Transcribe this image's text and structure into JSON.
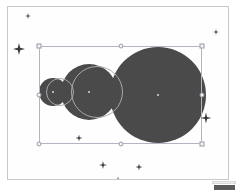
{
  "app": {
    "name": "vector-graphics-editor-canvas",
    "canvas_background": "#ffffff",
    "frame_border_color": "#c9c9c9"
  },
  "canvas": {
    "width": 237,
    "height": 191,
    "frame": {
      "x": 7,
      "y": 6,
      "width": 222,
      "height": 174
    }
  },
  "selection": {
    "label": "",
    "box": {
      "x": 38,
      "y": 45,
      "width": 163,
      "height": 98
    },
    "border_color": "#b4b4c4",
    "handle_fill": "#f4f4f6",
    "handle_border": "#9a9aa8",
    "handles": [
      {
        "name": "handle-top-left",
        "x": 38,
        "y": 45,
        "shape": "square"
      },
      {
        "name": "handle-top-center",
        "x": 119.5,
        "y": 45,
        "shape": "round"
      },
      {
        "name": "handle-top-right",
        "x": 201,
        "y": 45,
        "shape": "square"
      },
      {
        "name": "handle-middle-left",
        "x": 38,
        "y": 94,
        "shape": "round"
      },
      {
        "name": "handle-middle-right",
        "x": 201,
        "y": 94,
        "shape": "round"
      },
      {
        "name": "handle-bottom-left",
        "x": 38,
        "y": 143,
        "shape": "round"
      },
      {
        "name": "handle-bottom-center",
        "x": 119.5,
        "y": 143,
        "shape": "round"
      },
      {
        "name": "handle-bottom-right",
        "x": 201,
        "y": 143,
        "shape": "square"
      }
    ]
  },
  "shapes": [
    {
      "name": "circle-small",
      "type": "circle",
      "cx": 52,
      "cy": 91,
      "r": 14,
      "fill": "#4a4a4a",
      "style": "filled",
      "center_dot": true
    },
    {
      "name": "circle-medium",
      "type": "circle",
      "cx": 88,
      "cy": 91,
      "r": 28,
      "fill": "#4a4a4a",
      "style": "filled",
      "center_dot": true
    },
    {
      "name": "circle-large",
      "type": "circle",
      "cx": 157,
      "cy": 94,
      "r": 48,
      "fill": "#4a4a4a",
      "style": "filled",
      "center_dot": true
    },
    {
      "name": "circle-outline-overlay-small",
      "type": "circle",
      "cx": 59,
      "cy": 91,
      "r": 14,
      "fill": "none",
      "stroke": "#a9a9a9",
      "style": "outlined",
      "center_dot": false
    },
    {
      "name": "circle-outline-overlay-medium",
      "type": "circle",
      "cx": 96,
      "cy": 91,
      "r": 26,
      "fill": "none",
      "stroke": "#a9a9a9",
      "style": "outlined",
      "center_dot": false
    }
  ],
  "sparkles": [
    {
      "name": "sparkle-top-left-small",
      "x": 27,
      "y": 15,
      "size": 6,
      "color": "#3a3a3a"
    },
    {
      "name": "sparkle-left-large",
      "x": 18,
      "y": 48,
      "size": 12,
      "color": "#3a3a3a"
    },
    {
      "name": "sparkle-top-right",
      "x": 215,
      "y": 31,
      "size": 6,
      "color": "#3a3a3a"
    },
    {
      "name": "sparkle-right-large",
      "x": 205,
      "y": 117,
      "size": 11,
      "color": "#3a3a3a"
    },
    {
      "name": "sparkle-inner-bottom",
      "x": 78,
      "y": 137,
      "size": 7,
      "color": "#3a3a3a"
    },
    {
      "name": "sparkle-bottom-left",
      "x": 102,
      "y": 164,
      "size": 8,
      "color": "#3a3a3a"
    },
    {
      "name": "sparkle-bottom-right",
      "x": 138,
      "y": 166,
      "size": 7,
      "color": "#3a3a3a"
    },
    {
      "name": "sparkle-bottom-center",
      "x": 117,
      "y": 179,
      "size": 7,
      "color": "#3a3a3a"
    }
  ],
  "chrome": {
    "scrollbar_corner_color": "#5b5b5b",
    "scrollbar_rail_color": "#efefef"
  }
}
